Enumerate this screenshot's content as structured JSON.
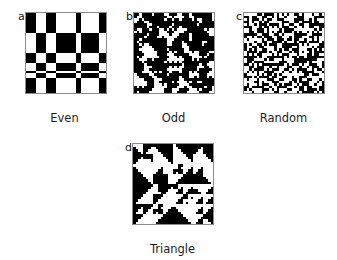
{
  "figure": {
    "kind": "binary-texture-panel-figure",
    "background_color": "#ffffff",
    "foreground_color": "#000000",
    "frame_color": "#8c8c8c",
    "text_color": "#1c1c1c",
    "panel_count": 4,
    "grid_size": 32,
    "cell_pixels": 2.5,
    "panel_pixel_size": 80
  },
  "panels": [
    {
      "id": "a",
      "letter": "a",
      "caption": "Even",
      "pattern_type": "even",
      "grid": 32,
      "seed": 1731,
      "density": 0.5,
      "description": "Orthogonal banded checkerboard of wide black and white rows and columns"
    },
    {
      "id": "b",
      "letter": "b",
      "caption": "Odd",
      "pattern_type": "odd",
      "grid": 32,
      "seed": 4409,
      "density": 0.5,
      "description": "Cross / plus shaped cellular texture on white ground"
    },
    {
      "id": "c",
      "letter": "c",
      "caption": "Random",
      "pattern_type": "random",
      "grid": 32,
      "seed": 8821,
      "density": 0.54,
      "description": "Unstructured random black and white pixel noise"
    },
    {
      "id": "d",
      "letter": "d",
      "caption": "Triangle",
      "pattern_type": "triangle",
      "grid": 32,
      "seed": 6157,
      "density": 0.5,
      "description": "Diagonal stepped triangular blocks of black on white"
    }
  ],
  "chart_data": {
    "type": "heatmap",
    "title": "",
    "xlabel": "",
    "ylabel": "",
    "grid": false,
    "legend_position": "none",
    "colormap": [
      "#ffffff",
      "#000000"
    ],
    "panel_labels": [
      "a",
      "b",
      "c",
      "d"
    ],
    "panel_captions": [
      "Even",
      "Odd",
      "Random",
      "Triangle"
    ],
    "matrix_dimensions": [
      32,
      32
    ],
    "value_levels": [
      0,
      1
    ],
    "series": [
      {
        "name": "Even",
        "panel": "a",
        "type": "even",
        "seed": 1731,
        "fill_fraction": 0.5
      },
      {
        "name": "Odd",
        "panel": "b",
        "type": "odd",
        "seed": 4409,
        "fill_fraction": 0.5
      },
      {
        "name": "Random",
        "panel": "c",
        "type": "random",
        "seed": 8821,
        "fill_fraction": 0.54
      },
      {
        "name": "Triangle",
        "panel": "d",
        "type": "triangle",
        "seed": 6157,
        "fill_fraction": 0.5
      }
    ]
  }
}
